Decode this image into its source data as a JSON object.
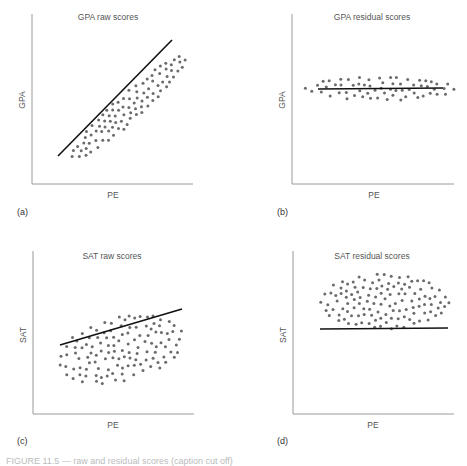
{
  "figure": {
    "caption": "FIGURE 11.5 — raw and residual scores (caption cut off)",
    "colors": {
      "axis": "#9a9a9a",
      "dot": "#6b6b6b",
      "line": "#111111"
    }
  },
  "chart_data": [
    {
      "type": "scatter",
      "panel": "(a)",
      "title": "GPA raw scores",
      "xlabel": "PE",
      "ylabel": "GPA",
      "grid": false,
      "ticks": false,
      "regression_line": {
        "slope_direction": "strong positive",
        "from": [
          0.12,
          0.17
        ],
        "to": [
          0.92,
          0.93
        ]
      },
      "point_cloud": {
        "shape": "narrow diagonal ellipse",
        "approx_points": 95,
        "correlation": "strong positive"
      },
      "frame": {
        "x": 32,
        "y": 14,
        "w": 161,
        "h": 170
      },
      "cloud": {
        "cx": 0.6,
        "cy": 0.55,
        "rx": 0.47,
        "ry": 0.08,
        "angle": -42,
        "n": 95,
        "seed": 11
      },
      "line": {
        "x1": 58,
        "y1": 156,
        "x2": 172,
        "y2": 40
      }
    },
    {
      "type": "scatter",
      "panel": "(b)",
      "title": "GPA residual scores",
      "xlabel": "PE",
      "ylabel": "GPA",
      "grid": false,
      "ticks": false,
      "regression_line": {
        "slope_direction": "flat (zero)",
        "from": [
          0.16,
          0.56
        ],
        "to": [
          0.93,
          0.56
        ]
      },
      "point_cloud": {
        "shape": "thin horizontal ellipse",
        "approx_points": 60,
        "correlation": "none"
      },
      "frame": {
        "x": 292,
        "y": 14,
        "w": 162,
        "h": 170
      },
      "cloud": {
        "cx": 0.53,
        "cy": 0.44,
        "rx": 0.47,
        "ry": 0.07,
        "angle": 0,
        "n": 62,
        "seed": 23
      },
      "line": {
        "x1": 318,
        "y1": 89,
        "x2": 443,
        "y2": 88
      }
    },
    {
      "type": "scatter",
      "panel": "(c)",
      "title": "SAT raw scores",
      "xlabel": "PE",
      "ylabel": "SAT",
      "grid": false,
      "ticks": false,
      "regression_line": {
        "slope_direction": "weak positive",
        "from": [
          0.17,
          0.48
        ],
        "to": [
          0.92,
          0.72
        ]
      },
      "point_cloud": {
        "shape": "wide tilted ellipse",
        "approx_points": 120,
        "correlation": "weak positive"
      },
      "frame": {
        "x": 33,
        "y": 251,
        "w": 161,
        "h": 163
      },
      "cloud": {
        "cx": 0.55,
        "cy": 0.6,
        "rx": 0.4,
        "ry": 0.2,
        "angle": -14,
        "n": 120,
        "seed": 37
      },
      "line": {
        "x1": 60,
        "y1": 345,
        "x2": 182,
        "y2": 309
      }
    },
    {
      "type": "scatter",
      "panel": "(d)",
      "title": "SAT residual scores",
      "xlabel": "PE",
      "ylabel": "SAT",
      "grid": false,
      "ticks": false,
      "regression_line": {
        "slope_direction": "flat (zero)",
        "from": [
          0.16,
          0.7
        ],
        "to": [
          0.97,
          0.7
        ]
      },
      "point_cloud": {
        "shape": "horizontal ellipse",
        "approx_points": 120,
        "correlation": "none"
      },
      "frame": {
        "x": 293,
        "y": 251,
        "w": 161,
        "h": 163
      },
      "cloud": {
        "cx": 0.57,
        "cy": 0.31,
        "rx": 0.4,
        "ry": 0.17,
        "angle": 0,
        "n": 120,
        "seed": 53
      },
      "line": {
        "x1": 320,
        "y1": 329,
        "x2": 448,
        "y2": 328
      }
    }
  ]
}
